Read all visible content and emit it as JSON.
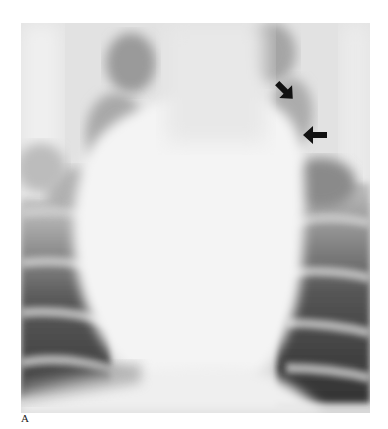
{
  "figure": {
    "panel_label": "A",
    "annotations": [
      {
        "type": "arrow",
        "direction": "down-left",
        "x": 282,
        "y": 90,
        "color": "#111111"
      },
      {
        "type": "arrow",
        "direction": "left",
        "x": 304,
        "y": 135,
        "color": "#111111"
      }
    ]
  }
}
